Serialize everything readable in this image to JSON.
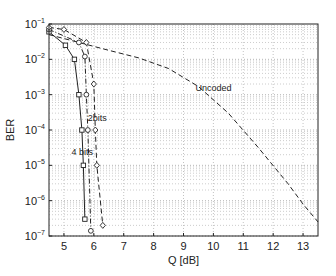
{
  "chart_data": {
    "type": "line",
    "title": "",
    "xlabel": "Q [dB]",
    "ylabel": "BER",
    "xlim": [
      4.5,
      13.5
    ],
    "ylim": [
      1e-07,
      0.1
    ],
    "yscale": "log",
    "grid": true,
    "x_ticks": [
      5,
      6,
      7,
      8,
      9,
      10,
      11,
      12,
      13
    ],
    "y_ticks": [
      -1,
      -2,
      -3,
      -4,
      -5,
      -6,
      -7
    ],
    "series": [
      {
        "name": "Uncoded",
        "style": "dashed",
        "marker": "none",
        "x": [
          4.5,
          5.5,
          6.5,
          7.5,
          8.5,
          9.5,
          10.5,
          11.5,
          12.5,
          13.0,
          13.5
        ],
        "y": [
          0.05,
          0.03,
          0.018,
          0.011,
          0.0055,
          0.0017,
          0.0003,
          3.2e-05,
          3e-06,
          8e-07,
          2.5e-07
        ]
      },
      {
        "name": "4 bits",
        "style": "solid",
        "marker": "square",
        "x": [
          4.5,
          5.05,
          5.35,
          5.5,
          5.6,
          5.65,
          5.7
        ],
        "y": [
          0.06,
          0.025,
          0.01,
          0.001,
          0.0001,
          1e-05,
          3e-07
        ]
      },
      {
        "name": "2 bits",
        "style": "dashdot",
        "marker": "circle",
        "x": [
          4.5,
          5.5,
          5.7,
          5.75,
          5.8,
          5.9
        ],
        "y": [
          0.07,
          0.03,
          0.012,
          0.001,
          0.0001,
          1.4e-07
        ]
      },
      {
        "name": "",
        "style": "dashed",
        "marker": "diamond",
        "x": [
          4.5,
          5.0,
          5.75,
          6.0,
          6.05,
          6.1,
          6.3
        ],
        "y": [
          0.08,
          0.07,
          0.03,
          0.002,
          0.0001,
          1e-05,
          2e-07
        ]
      }
    ],
    "annotations": [
      {
        "text": "Uncoded",
        "x": 9.4,
        "y": 0.0013
      },
      {
        "text": "2bits",
        "x": 5.8,
        "y": 0.00018
      },
      {
        "text": "4 bits",
        "x": 5.25,
        "y": 2e-05
      }
    ]
  }
}
